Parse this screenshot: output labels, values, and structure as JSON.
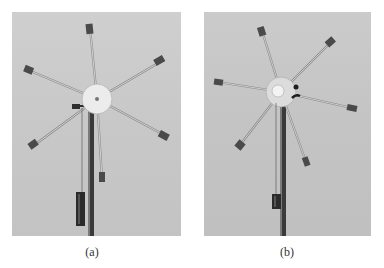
{
  "figure": {
    "panels": [
      {
        "label": "(a)",
        "description": "Photograph of rotating wheel with six spokes tipped with weights, hanging mass on string, supported by vertical pole",
        "background": "#c9c9c9"
      },
      {
        "label": "(b)",
        "description": "Same apparatus rotated to a different angular position, hanging mass raised",
        "background": "#c6c6c6"
      }
    ]
  }
}
